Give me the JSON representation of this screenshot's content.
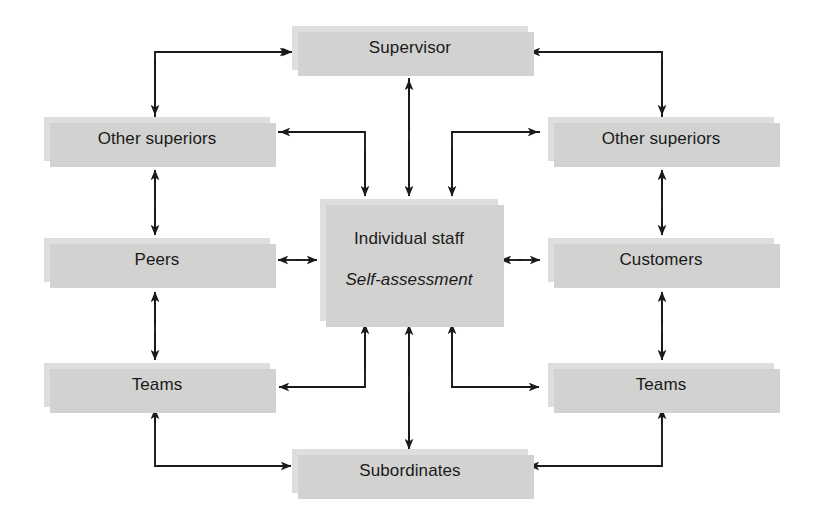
{
  "diagram": {
    "type": "flow-diagram",
    "background_color": "#ffffff",
    "box_fill_color": "#dededd",
    "box_shadow_color": "#d2d2d1",
    "line_color": "#1a1a1a",
    "text_color": "#1a1a1a",
    "nodes": [
      {
        "id": "supervisor",
        "label": "Supervisor",
        "sub": "",
        "x": 292,
        "y": 26,
        "w": 236,
        "h": 44
      },
      {
        "id": "other-superiors-left",
        "label": "Other superiors",
        "sub": "",
        "x": 44,
        "y": 117,
        "w": 226,
        "h": 44
      },
      {
        "id": "other-superiors-right",
        "label": "Other superiors",
        "sub": "",
        "x": 548,
        "y": 117,
        "w": 226,
        "h": 44
      },
      {
        "id": "peers",
        "label": "Peers",
        "sub": "",
        "x": 44,
        "y": 238,
        "w": 226,
        "h": 44
      },
      {
        "id": "customers",
        "label": "Customers",
        "sub": "",
        "x": 548,
        "y": 238,
        "w": 226,
        "h": 44
      },
      {
        "id": "individual-staff",
        "label": "Individual staff",
        "sub": "Self-assessment",
        "x": 320,
        "y": 199,
        "w": 178,
        "h": 122
      },
      {
        "id": "teams-left",
        "label": "Teams",
        "sub": "",
        "x": 44,
        "y": 363,
        "w": 226,
        "h": 44
      },
      {
        "id": "teams-right",
        "label": "Teams",
        "sub": "",
        "x": 548,
        "y": 363,
        "w": 226,
        "h": 44
      },
      {
        "id": "subordinates",
        "label": "Subordinates",
        "sub": "",
        "x": 292,
        "y": 449,
        "w": 236,
        "h": 44
      }
    ],
    "connections": [
      {
        "from": "other-superiors-left",
        "to": "supervisor",
        "style": "elbow",
        "arrows": "both-ends"
      },
      {
        "from": "other-superiors-right",
        "to": "supervisor",
        "style": "elbow",
        "arrows": "both-ends"
      },
      {
        "from": "supervisor",
        "to": "individual-staff",
        "style": "straight-vertical",
        "arrows": "double"
      },
      {
        "from": "other-superiors-left",
        "to": "individual-staff",
        "style": "elbow",
        "arrows": "both-ends"
      },
      {
        "from": "other-superiors-right",
        "to": "individual-staff",
        "style": "elbow",
        "arrows": "both-ends"
      },
      {
        "from": "other-superiors-left",
        "to": "peers",
        "style": "straight-vertical",
        "arrows": "double"
      },
      {
        "from": "other-superiors-right",
        "to": "customers",
        "style": "straight-vertical",
        "arrows": "double"
      },
      {
        "from": "peers",
        "to": "individual-staff",
        "style": "straight-horizontal",
        "arrows": "double"
      },
      {
        "from": "customers",
        "to": "individual-staff",
        "style": "straight-horizontal",
        "arrows": "double"
      },
      {
        "from": "peers",
        "to": "teams-left",
        "style": "straight-vertical",
        "arrows": "double"
      },
      {
        "from": "customers",
        "to": "teams-right",
        "style": "straight-vertical",
        "arrows": "double"
      },
      {
        "from": "individual-staff",
        "to": "teams-left",
        "style": "elbow",
        "arrows": "both-ends"
      },
      {
        "from": "individual-staff",
        "to": "teams-right",
        "style": "elbow",
        "arrows": "both-ends"
      },
      {
        "from": "individual-staff",
        "to": "subordinates",
        "style": "straight-vertical",
        "arrows": "double"
      },
      {
        "from": "teams-left",
        "to": "subordinates",
        "style": "elbow",
        "arrows": "both-ends"
      },
      {
        "from": "teams-right",
        "to": "subordinates",
        "style": "elbow",
        "arrows": "both-ends"
      }
    ]
  }
}
